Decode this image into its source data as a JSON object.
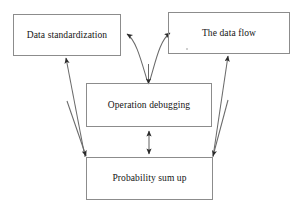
{
  "diagram": {
    "type": "flowchart",
    "background_color": "#ffffff",
    "box_border_color": "#8c8c8c",
    "connector_color": "#5a5a5a",
    "text_color": "#131313",
    "nodes": [
      {
        "id": "data-standardization",
        "label": "Data standardization",
        "x": 13,
        "y": 14,
        "width": 108,
        "height": 42
      },
      {
        "id": "the-data-flow",
        "label": "The data flow",
        "x": 168,
        "y": 12,
        "width": 122,
        "height": 42
      },
      {
        "id": "operation-debugging",
        "label": "Operation debugging",
        "x": 86,
        "y": 83,
        "width": 126,
        "height": 44
      },
      {
        "id": "probability-sum-up",
        "label": "Probability sum up",
        "x": 86,
        "y": 157,
        "width": 127,
        "height": 43
      }
    ],
    "edges": [
      {
        "id": "operation-debugging-to-data-standardization",
        "from": "operation-debugging",
        "to": "data-standardization",
        "style": "curved",
        "arrowheads": "end"
      },
      {
        "id": "operation-debugging-to-the-data-flow",
        "from": "operation-debugging",
        "to": "the-data-flow",
        "style": "curved",
        "arrowheads": "end"
      },
      {
        "id": "into-operation-debugging",
        "from": "curve-junction",
        "to": "operation-debugging",
        "style": "straight",
        "arrowheads": "end"
      },
      {
        "id": "probability-sum-up-to-data-standardization",
        "from": "probability-sum-up",
        "to": "data-standardization",
        "style": "diagonal",
        "arrowheads": "end"
      },
      {
        "id": "probability-sum-up-to-the-data-flow",
        "from": "probability-sum-up",
        "to": "the-data-flow",
        "style": "diagonal",
        "arrowheads": "end"
      },
      {
        "id": "operation-debugging-probability-sum-up",
        "from": "operation-debugging",
        "to": "probability-sum-up",
        "style": "straight",
        "arrowheads": "both"
      },
      {
        "id": "data-standardization-to-probability-sum-up",
        "from": "data-standardization",
        "to": "probability-sum-up",
        "style": "diagonal",
        "arrowheads": "end"
      },
      {
        "id": "the-data-flow-to-probability-sum-up",
        "from": "the-data-flow",
        "to": "probability-sum-up",
        "style": "diagonal",
        "arrowheads": "end"
      }
    ]
  }
}
